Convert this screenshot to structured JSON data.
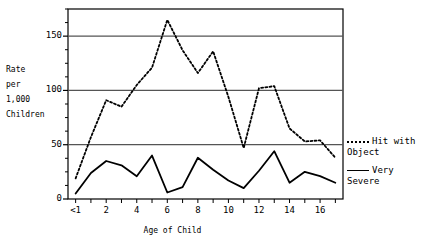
{
  "chart_data": {
    "type": "line",
    "title": "",
    "xlabel": "Age of Child",
    "ylabel": "Rate per 1,000 Children",
    "ylabel_lines": [
      "Rate",
      "per",
      "1,000",
      "Children"
    ],
    "categories": [
      "<1",
      "1",
      "2",
      "3",
      "4",
      "5",
      "6",
      "7",
      "8",
      "9",
      "10",
      "11",
      "12",
      "13",
      "14",
      "15",
      "16",
      "17"
    ],
    "xtick_labels": [
      "<1",
      "2",
      "4",
      "6",
      "8",
      "10",
      "12",
      "14",
      "16"
    ],
    "xtick_categories": [
      "<1",
      "2",
      "4",
      "6",
      "8",
      "10",
      "12",
      "14",
      "16"
    ],
    "ytick_labels": [
      "0",
      "50",
      "100",
      "150"
    ],
    "yticks": [
      0,
      50,
      100,
      150
    ],
    "ylim": [
      0,
      175
    ],
    "grid": "horizontal",
    "gridlines": [
      50,
      100,
      150
    ],
    "legend_position": "right",
    "series": [
      {
        "name": "Hit with Object",
        "style": "dotted",
        "color": "#000000",
        "values": [
          19,
          57,
          91,
          85,
          105,
          121,
          165,
          137,
          116,
          136,
          94,
          47,
          102,
          104,
          65,
          53,
          54,
          38
        ]
      },
      {
        "name": "Very Severe",
        "style": "solid",
        "color": "#000000",
        "values": [
          5,
          24,
          35,
          31,
          21,
          40,
          6,
          11,
          38,
          27,
          17,
          10,
          26,
          44,
          15,
          25,
          21,
          15
        ]
      }
    ]
  },
  "legend": {
    "entries": [
      {
        "label": "Hit with\nObject",
        "style": "dotted"
      },
      {
        "label": "Very\nSevere",
        "style": "solid"
      }
    ]
  }
}
